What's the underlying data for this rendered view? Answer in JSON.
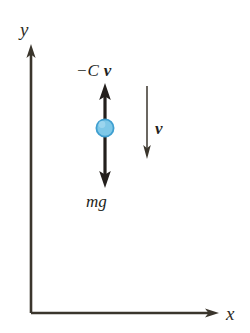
{
  "figure": {
    "background_color": "#ffffff"
  },
  "axes": {
    "color": "#3a352c",
    "origin": {
      "x": 31,
      "y": 313
    },
    "y_axis": {
      "label": "y",
      "label_x": 20,
      "label_y": 36,
      "from_y": 313,
      "to_y": 45
    },
    "x_axis": {
      "label": "x",
      "label_x": 226,
      "label_y": 320,
      "from_x": 31,
      "to_x": 218
    }
  },
  "body": {
    "name": "sphere",
    "center_x": 105,
    "center_y": 128,
    "radius": 9,
    "fill_color": "#7ec8e8",
    "stroke_color": "#3f9fd0"
  },
  "forces": [
    {
      "id": "drag",
      "label": "−C",
      "vector_symbol": "v",
      "label_x": 76,
      "label_y": 76,
      "direction": "up",
      "color": "#231f1c",
      "tail_y": 128,
      "head_y": 84,
      "x": 105
    },
    {
      "id": "weight",
      "label": "mg",
      "vector_symbol": "",
      "label_x": 86,
      "label_y": 207,
      "direction": "down",
      "color": "#231f1c",
      "tail_y": 128,
      "head_y": 187,
      "x": 105
    }
  ],
  "velocity": {
    "id": "velocity",
    "symbol": "v",
    "label_x": 155,
    "label_y": 134,
    "direction": "down",
    "color": "#3a352c",
    "x": 147,
    "from_y": 86,
    "to_y": 158
  }
}
